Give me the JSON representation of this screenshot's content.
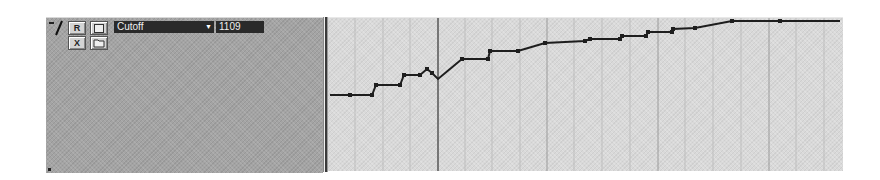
{
  "track": {
    "collapse_symbol": "−",
    "record_button": "R",
    "write_button": "W",
    "delete_button": "X",
    "parameter": {
      "selected": "Cutoff",
      "dropdown_arrow": "▼"
    },
    "value": "1109"
  },
  "automation": {
    "line_color": "#1e1e1e",
    "background": "#d9d9d9",
    "cursor_x": 110,
    "major_gridlines_x": [
      110,
      219,
      330,
      441
    ],
    "minor_gridlines_x": [
      27,
      55,
      82,
      137,
      164,
      192,
      246,
      274,
      302,
      357,
      385,
      413,
      468,
      496
    ],
    "points": [
      [
        2,
        77
      ],
      [
        22,
        77
      ],
      [
        44,
        77
      ],
      [
        48,
        67
      ],
      [
        72,
        67
      ],
      [
        76,
        57
      ],
      [
        92,
        57
      ],
      [
        99,
        51
      ],
      [
        104,
        55
      ],
      [
        110,
        61
      ],
      [
        134,
        41
      ],
      [
        160,
        41
      ],
      [
        162,
        33
      ],
      [
        190,
        33
      ],
      [
        217,
        25
      ],
      [
        257,
        23
      ],
      [
        262,
        21
      ],
      [
        292,
        21
      ],
      [
        294,
        18
      ],
      [
        318,
        18
      ],
      [
        320,
        14
      ],
      [
        344,
        14
      ],
      [
        345,
        11
      ],
      [
        367,
        10
      ],
      [
        404,
        3
      ],
      [
        452,
        3
      ],
      [
        512,
        3
      ]
    ],
    "node_indices": [
      1,
      2,
      3,
      4,
      5,
      6,
      7,
      8,
      10,
      11,
      12,
      13,
      14,
      15,
      16,
      17,
      18,
      19,
      20,
      21,
      22,
      23,
      24,
      25
    ]
  }
}
